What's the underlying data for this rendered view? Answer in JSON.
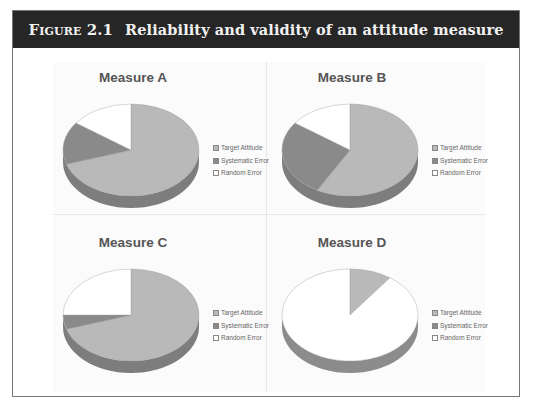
{
  "figure": {
    "label": "Figure 2.1",
    "title": "Reliability and validity of an attitude measure"
  },
  "colors": {
    "target": "#b9b9b9",
    "systematic": "#8a8a8a",
    "random": "#ffffff",
    "header_bg": "#262626"
  },
  "legend": [
    "Target Attitude",
    "Systematic Error",
    "Random Error"
  ],
  "chart_data": [
    {
      "type": "pie",
      "title": "Measure A",
      "categories": [
        "Target Attitude",
        "Systematic Error",
        "Random Error"
      ],
      "values": [
        70,
        15,
        15
      ]
    },
    {
      "type": "pie",
      "title": "Measure B",
      "categories": [
        "Target Attitude",
        "Systematic Error",
        "Random Error"
      ],
      "values": [
        58,
        27,
        15
      ]
    },
    {
      "type": "pie",
      "title": "Measure C",
      "categories": [
        "Target Attitude",
        "Systematic Error",
        "Random Error"
      ],
      "values": [
        70,
        5,
        25
      ]
    },
    {
      "type": "pie",
      "title": "Measure D",
      "categories": [
        "Target Attitude",
        "Systematic Error",
        "Random Error"
      ],
      "values": [
        10,
        0,
        90
      ]
    }
  ]
}
